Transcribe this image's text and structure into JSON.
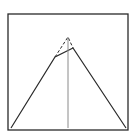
{
  "diagram": {
    "type": "geometric-figure",
    "colors": {
      "background": "#ffffff",
      "stroke": "#2a2a2a",
      "center_line": "#8a8a8a"
    },
    "frame": {
      "x": 8,
      "y": 14,
      "width": 120,
      "height": 116
    },
    "solid_outline": {
      "points": [
        [
          11,
          128
        ],
        [
          55,
          57
        ],
        [
          73,
          48
        ],
        [
          126,
          128
        ]
      ]
    },
    "dashed_apex": {
      "points": [
        [
          55,
          57
        ],
        [
          68,
          37
        ],
        [
          73,
          48
        ]
      ]
    },
    "center_line": {
      "x1": 68,
      "y1": 37,
      "x2": 68,
      "y2": 128
    }
  }
}
